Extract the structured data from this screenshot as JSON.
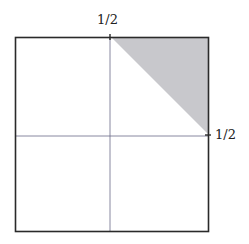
{
  "diagram": {
    "type": "unit-square-partition",
    "labels": {
      "top_tick": "1/2",
      "right_tick": "1/2"
    },
    "shaded_region": {
      "shape": "triangle",
      "description": "upper-right corner triangle bounded by x = 1/2, top edge, and y = 1/2 on right edge",
      "fill": "#c8c8cc"
    },
    "colors": {
      "border": "#2a2a2a",
      "axis_lines": "#6a6a88",
      "shade": "#c8c8cc"
    }
  }
}
